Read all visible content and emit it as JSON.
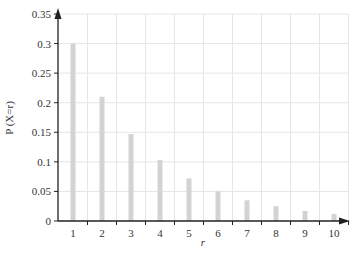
{
  "chart_data": {
    "type": "bar",
    "title": "",
    "xlabel": "r",
    "ylabel": "P (X=r)",
    "categories": [
      "1",
      "2",
      "3",
      "4",
      "5",
      "6",
      "7",
      "8",
      "9",
      "10"
    ],
    "values": [
      0.3,
      0.21,
      0.147,
      0.103,
      0.072,
      0.05,
      0.035,
      0.025,
      0.017,
      0.012
    ],
    "ylim": [
      0,
      0.35
    ],
    "yticks": [
      "0",
      "0.05",
      "0.1",
      "0.15",
      "0.2",
      "0.25",
      "0.3",
      "0.35"
    ],
    "ytick_values": [
      0,
      0.05,
      0.1,
      0.15,
      0.2,
      0.25,
      0.3,
      0.35
    ],
    "grid": true,
    "legend": null
  },
  "colors": {
    "bar": "#d3d3d3",
    "grid": "#e6e6e6",
    "axis": "#222222"
  }
}
